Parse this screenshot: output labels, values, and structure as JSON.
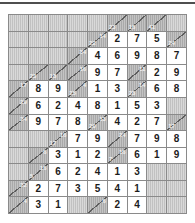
{
  "puzzle": {
    "type": "kakuro",
    "state": "solved",
    "rows": 12,
    "cols": 9,
    "colors": {
      "page_bg": "#ffffff",
      "top_rule": "#4f4f4f",
      "grid_line": "#8a8a8a",
      "blank_cell_bg": "#cbcbcb",
      "clue_cell_bg": "#b2b2b2",
      "clue_diagonal": "#5e5e5e",
      "clue_text": "#f2f2f2",
      "value_cell_bg": "#ffffff",
      "digit_color": "#1c1c1c"
    },
    "grid": [
      [
        {
          "t": "b"
        },
        {
          "t": "b"
        },
        {
          "t": "b"
        },
        {
          "t": "b"
        },
        {
          "t": "b"
        },
        {
          "t": "c",
          "d": 23
        },
        {
          "t": "c",
          "d": 16
        },
        {
          "t": "c",
          "d": 41
        },
        {
          "t": "b"
        }
      ],
      [
        {
          "t": "b"
        },
        {
          "t": "b"
        },
        {
          "t": "b"
        },
        {
          "t": "b"
        },
        {
          "t": "c",
          "d": 22,
          "a": 14
        },
        {
          "t": "v",
          "v": 2
        },
        {
          "t": "v",
          "v": 7
        },
        {
          "t": "v",
          "v": 5
        },
        {
          "t": "c",
          "d": 24
        }
      ],
      [
        {
          "t": "b"
        },
        {
          "t": "b"
        },
        {
          "t": "b"
        },
        {
          "t": "c",
          "a": 34
        },
        {
          "t": "v",
          "v": 4
        },
        {
          "t": "v",
          "v": 6
        },
        {
          "t": "v",
          "v": 9
        },
        {
          "t": "v",
          "v": 8
        },
        {
          "t": "v",
          "v": 7
        }
      ],
      [
        {
          "t": "b"
        },
        {
          "t": "c",
          "d": 23
        },
        {
          "t": "c",
          "d": 18
        },
        {
          "t": "c",
          "a": 16
        },
        {
          "t": "v",
          "v": 9
        },
        {
          "t": "v",
          "v": 7
        },
        {
          "t": "c",
          "a": 11
        },
        {
          "t": "v",
          "v": 2
        },
        {
          "t": "v",
          "v": 9
        }
      ],
      [
        {
          "t": "c",
          "a": 17
        },
        {
          "t": "v",
          "v": 8
        },
        {
          "t": "v",
          "v": 9
        },
        {
          "t": "c",
          "d": 25,
          "a": 4
        },
        {
          "t": "v",
          "v": 1
        },
        {
          "t": "v",
          "v": 3
        },
        {
          "t": "c",
          "d": 28,
          "a": 14
        },
        {
          "t": "v",
          "v": 6
        },
        {
          "t": "v",
          "v": 8
        }
      ],
      [
        {
          "t": "c",
          "a": 29
        },
        {
          "t": "v",
          "v": 6
        },
        {
          "t": "v",
          "v": 2
        },
        {
          "t": "v",
          "v": 4
        },
        {
          "t": "v",
          "v": 8
        },
        {
          "t": "v",
          "v": 1
        },
        {
          "t": "v",
          "v": 5
        },
        {
          "t": "v",
          "v": 3
        },
        {
          "t": "b"
        }
      ],
      [
        {
          "t": "c",
          "a": 24
        },
        {
          "t": "v",
          "v": 9
        },
        {
          "t": "v",
          "v": 7
        },
        {
          "t": "v",
          "v": 8
        },
        {
          "t": "c",
          "d": 20,
          "a": 13
        },
        {
          "t": "v",
          "v": 4
        },
        {
          "t": "v",
          "v": 2
        },
        {
          "t": "v",
          "v": 7
        },
        {
          "t": "c",
          "d": 17
        }
      ],
      [
        {
          "t": "b"
        },
        {
          "t": "b"
        },
        {
          "t": "c",
          "d": 17,
          "a": 16
        },
        {
          "t": "v",
          "v": 7
        },
        {
          "t": "v",
          "v": 9
        },
        {
          "t": "c",
          "a": 24
        },
        {
          "t": "v",
          "v": 7
        },
        {
          "t": "v",
          "v": 9
        },
        {
          "t": "v",
          "v": 8
        }
      ],
      [
        {
          "t": "b"
        },
        {
          "t": "c",
          "a": 6
        },
        {
          "t": "v",
          "v": 3
        },
        {
          "t": "v",
          "v": 1
        },
        {
          "t": "v",
          "v": 2
        },
        {
          "t": "c",
          "d": 7,
          "a": 16
        },
        {
          "t": "v",
          "v": 6
        },
        {
          "t": "v",
          "v": 1
        },
        {
          "t": "v",
          "v": 9
        }
      ],
      [
        {
          "t": "b"
        },
        {
          "t": "c",
          "d": 5,
          "a": 16
        },
        {
          "t": "v",
          "v": 6
        },
        {
          "t": "v",
          "v": 2
        },
        {
          "t": "v",
          "v": 4
        },
        {
          "t": "v",
          "v": 1
        },
        {
          "t": "v",
          "v": 3
        },
        {
          "t": "b"
        },
        {
          "t": "b"
        }
      ],
      [
        {
          "t": "c",
          "a": 22
        },
        {
          "t": "v",
          "v": 2
        },
        {
          "t": "v",
          "v": 7
        },
        {
          "t": "v",
          "v": 3
        },
        {
          "t": "v",
          "v": 5
        },
        {
          "t": "v",
          "v": 4
        },
        {
          "t": "v",
          "v": 1
        },
        {
          "t": "b"
        },
        {
          "t": "b"
        }
      ],
      [
        {
          "t": "c",
          "a": 4
        },
        {
          "t": "v",
          "v": 3
        },
        {
          "t": "v",
          "v": 1
        },
        {
          "t": "b"
        },
        {
          "t": "c",
          "a": 6
        },
        {
          "t": "v",
          "v": 2
        },
        {
          "t": "v",
          "v": 4
        },
        {
          "t": "b"
        },
        {
          "t": "b"
        }
      ]
    ]
  }
}
